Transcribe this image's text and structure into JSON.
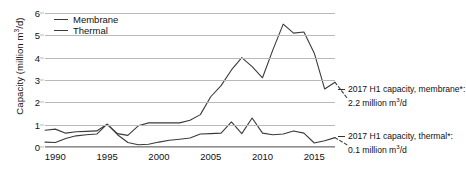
{
  "axes": {
    "y_title_prefix": "Capacity (million m",
    "y_title_sup": "3",
    "y_title_suffix": "/d)"
  },
  "legend": {
    "items": [
      {
        "label": "Membrane",
        "color": "#3b3b3b"
      },
      {
        "label": "Thermal",
        "color": "#3b3b3b"
      }
    ]
  },
  "annotations": {
    "membrane": {
      "line1_prefix": "2017 H1 capacity, membrane*:",
      "line2_prefix": "2.2 million m",
      "line2_sup": "3",
      "line2_suffix": "/d"
    },
    "thermal": {
      "line1_prefix": "2017 H1 capacity, thermal*:",
      "line2_prefix": "0.1 million m",
      "line2_sup": "3",
      "line2_suffix": "/d"
    }
  },
  "chart_data": {
    "type": "line",
    "title": "",
    "xlabel": "",
    "ylabel": "Capacity (million m3/d)",
    "xlim": [
      1989,
      2017
    ],
    "ylim": [
      0,
      6
    ],
    "yticks": [
      0,
      1,
      2,
      3,
      4,
      5,
      6
    ],
    "xticks": [
      1990,
      1995,
      2000,
      2005,
      2010,
      2015
    ],
    "grid": true,
    "legend_position": "top-left",
    "x": [
      1989,
      1990,
      1991,
      1992,
      1993,
      1994,
      1995,
      1996,
      1997,
      1998,
      1999,
      2000,
      2001,
      2002,
      2003,
      2004,
      2005,
      2006,
      2007,
      2008,
      2009,
      2010,
      2011,
      2012,
      2013,
      2014,
      2015,
      2016,
      2017
    ],
    "series": [
      {
        "name": "Membrane",
        "color": "#3b3b3b",
        "values": [
          0.75,
          0.8,
          0.62,
          0.68,
          0.7,
          0.72,
          1.02,
          0.6,
          0.52,
          0.95,
          1.08,
          1.08,
          1.08,
          1.08,
          1.2,
          1.45,
          2.25,
          2.75,
          3.45,
          4.0,
          3.6,
          3.1,
          4.35,
          5.5,
          5.1,
          5.15,
          4.2,
          2.6,
          2.9
        ],
        "final_dashed_to": 2.2,
        "final_dashed_label": "2017 H1 capacity, membrane*: 2.2 million m3/d"
      },
      {
        "name": "Thermal",
        "color": "#3b3b3b",
        "values": [
          0.22,
          0.2,
          0.38,
          0.5,
          0.55,
          0.58,
          1.02,
          0.55,
          0.2,
          0.1,
          0.12,
          0.22,
          0.3,
          0.35,
          0.4,
          0.58,
          0.6,
          0.62,
          1.12,
          0.6,
          1.3,
          0.62,
          0.55,
          0.58,
          0.72,
          0.62,
          0.18,
          0.28,
          0.42
        ],
        "final_dashed_to": 0.1,
        "final_dashed_label": "2017 H1 capacity, thermal*: 0.1 million m3/d"
      }
    ]
  }
}
